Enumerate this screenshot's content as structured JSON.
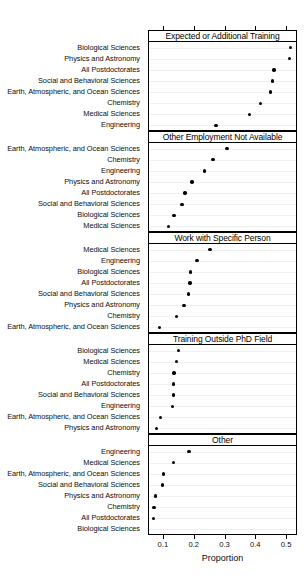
{
  "chart_data": {
    "type": "scatter",
    "title": "",
    "xlabel": "Proportion",
    "ylabel": "",
    "xlim": [
      0.055,
      0.532
    ],
    "xticks": [
      0.1,
      0.2,
      0.3,
      0.4,
      0.5
    ],
    "xtick_labels": [
      "0.1",
      "0.2",
      "0.3",
      "0.4",
      "0.5"
    ],
    "grid": true,
    "legend": "none",
    "layout": "5 stacked dot-plot panels, shared x-axis, per-panel sorted categories",
    "panels": [
      {
        "label": "Expected or Additional Training",
        "categories": [
          "Biological Sciences",
          "Physics and Astronomy",
          "All Postdoctorates",
          "Social and Behavioral Sciences",
          "Earth, Atmospheric, and Ocean Sciences",
          "Chemistry",
          "Medical Sciences",
          "Engineering"
        ],
        "values": [
          0.511,
          0.507,
          0.457,
          0.452,
          0.445,
          0.413,
          0.378,
          0.269
        ]
      },
      {
        "label": "Other Employment Not Available",
        "categories": [
          "Earth, Atmospheric, and Ocean Sciences",
          "Chemistry",
          "Engineering",
          "Physics and Astronomy",
          "All Postdoctorates",
          "Social and Behavioral Sciences",
          "Biological Sciences",
          "Medical Sciences"
        ],
        "values": [
          0.305,
          0.259,
          0.232,
          0.191,
          0.169,
          0.159,
          0.133,
          0.115
        ]
      },
      {
        "label": "Work with Specific Person",
        "categories": [
          "Medical Sciences",
          "Engineering",
          "Biological Sciences",
          "All Postdoctorates",
          "Social and Behavioral Sciences",
          "Physics and Astronomy",
          "Chemistry",
          "Earth, Atmospheric, and Ocean Sciences"
        ],
        "values": [
          0.25,
          0.207,
          0.187,
          0.185,
          0.179,
          0.165,
          0.141,
          0.086
        ]
      },
      {
        "label": "Training Outside PhD Field",
        "categories": [
          "Biological Sciences",
          "Medical Sciences",
          "Chemistry",
          "All Postdoctorates",
          "Social and Behavioral Sciences",
          "Engineering",
          "Earth, Atmospheric, and Ocean Sciences",
          "Physics and Astronomy"
        ],
        "values": [
          0.148,
          0.141,
          0.133,
          0.131,
          0.131,
          0.128,
          0.09,
          0.076
        ]
      },
      {
        "label": "Other",
        "categories": [
          "Engineering",
          "Medical Sciences",
          "Earth, Atmospheric, and Ocean Sciences",
          "Social and Behavioral Sciences",
          "Physics and Astronomy",
          "Chemistry",
          "All Postdoctorates",
          "Biological Sciences"
        ],
        "values": [
          0.181,
          0.131,
          0.098,
          0.095,
          0.072,
          0.068,
          0.067,
          0.04
        ]
      }
    ]
  }
}
